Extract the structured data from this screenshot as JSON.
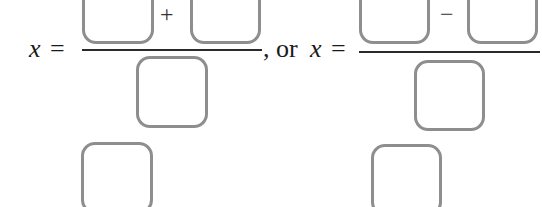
{
  "equation": {
    "left": {
      "variable": "x",
      "equals": "=",
      "numerator_operator": "+",
      "separator": ", or"
    },
    "right": {
      "variable": "x",
      "equals": "=",
      "numerator_operator": "−"
    }
  },
  "answer_boxes": {
    "count": 8,
    "left_numerator_1": "",
    "left_numerator_2": "",
    "left_denominator": "",
    "left_extra": "",
    "right_numerator_1": "",
    "right_numerator_2": "",
    "right_denominator": "",
    "right_extra": ""
  },
  "colors": {
    "box_border": "#8e8e8e",
    "text": "#1a1a1a",
    "background": "#ffffff"
  }
}
